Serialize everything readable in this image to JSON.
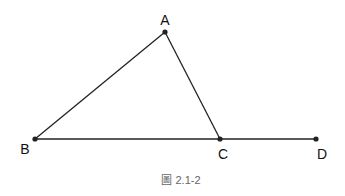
{
  "figure": {
    "caption": "圖 2.1-2",
    "line_color": "#222222",
    "points": [
      {
        "id": "A",
        "label": "A"
      },
      {
        "id": "B",
        "label": "B"
      },
      {
        "id": "C",
        "label": "C"
      },
      {
        "id": "D",
        "label": "D"
      }
    ],
    "segments": [
      {
        "from": "B",
        "to": "A"
      },
      {
        "from": "A",
        "to": "C"
      },
      {
        "from": "B",
        "to": "D"
      }
    ]
  }
}
